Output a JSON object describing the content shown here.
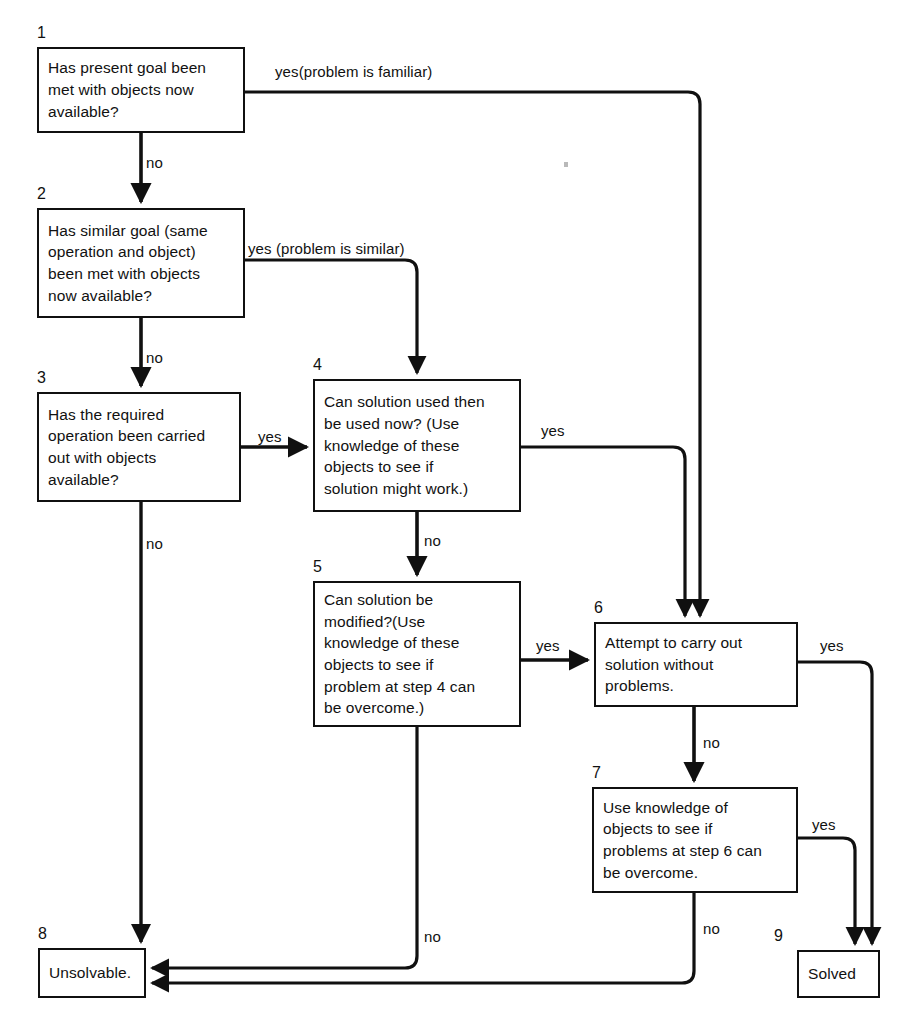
{
  "diagram": {
    "type": "flowchart",
    "stroke_color": "#101010",
    "background_color": "#ffffff",
    "nodes": [
      {
        "id": "1",
        "number": "1",
        "text": "Has present goal been\nmet with objects now\navailable?",
        "x": 37,
        "y": 47,
        "w": 208,
        "h": 86
      },
      {
        "id": "2",
        "number": "2",
        "text": "Has similar goal (same\noperation and object)\nbeen met with objects\nnow available?",
        "x": 37,
        "y": 208,
        "w": 208,
        "h": 110
      },
      {
        "id": "3",
        "number": "3",
        "text": "Has the required\noperation been carried\nout with objects\navailable?",
        "x": 37,
        "y": 392,
        "w": 204,
        "h": 110
      },
      {
        "id": "4",
        "number": "4",
        "text": "Can solution used then\nbe used now? (Use\nknowledge of these\nobjects to see if\nsolution might work.)",
        "x": 313,
        "y": 379,
        "w": 208,
        "h": 133
      },
      {
        "id": "5",
        "number": "5",
        "text": "Can solution be\nmodified?(Use\nknowledge of these\nobjects to see if\nproblem at step 4 can\nbe overcome.)",
        "x": 313,
        "y": 581,
        "w": 208,
        "h": 146
      },
      {
        "id": "6",
        "number": "6",
        "text": "Attempt to carry out\nsolution without\nproblems.",
        "x": 594,
        "y": 622,
        "w": 204,
        "h": 85
      },
      {
        "id": "7",
        "number": "7",
        "text": "Use knowledge of\nobjects to see if\nproblems at step 6 can\nbe overcome.",
        "x": 592,
        "y": 787,
        "w": 206,
        "h": 106
      },
      {
        "id": "8",
        "number": "8",
        "text": "Unsolvable.",
        "x": 38,
        "y": 948,
        "w": 108,
        "h": 50
      },
      {
        "id": "9",
        "number": "9",
        "text": "Solved",
        "x": 797,
        "y": 950,
        "w": 83,
        "h": 48
      }
    ],
    "edge_labels": [
      {
        "id": "l1",
        "text": "yes(problem is familiar)",
        "x": 275,
        "y": 63
      },
      {
        "id": "l2",
        "text": "no",
        "x": 146,
        "y": 154
      },
      {
        "id": "l3",
        "text": "yes (problem is similar)",
        "x": 248,
        "y": 240
      },
      {
        "id": "l4",
        "text": "no",
        "x": 146,
        "y": 349
      },
      {
        "id": "l5",
        "text": "yes",
        "x": 258,
        "y": 428
      },
      {
        "id": "l6",
        "text": "yes",
        "x": 541,
        "y": 422
      },
      {
        "id": "l7",
        "text": "no",
        "x": 424,
        "y": 532
      },
      {
        "id": "l8",
        "text": "no",
        "x": 146,
        "y": 535
      },
      {
        "id": "l9",
        "text": "yes",
        "x": 536,
        "y": 637
      },
      {
        "id": "l10",
        "text": "yes",
        "x": 820,
        "y": 637
      },
      {
        "id": "l11",
        "text": "no",
        "x": 703,
        "y": 734
      },
      {
        "id": "l12",
        "text": "yes",
        "x": 812,
        "y": 816
      },
      {
        "id": "l13",
        "text": "no",
        "x": 424,
        "y": 928
      },
      {
        "id": "l14",
        "text": "no",
        "x": 703,
        "y": 920
      }
    ]
  }
}
